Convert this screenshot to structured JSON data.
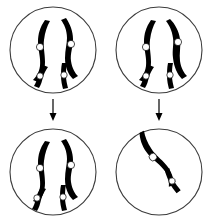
{
  "diagram": {
    "background_color": "#ffffff",
    "outline_color": "#3c3c3c",
    "chromosome_color": "#000000",
    "centromere_color": "#ffffff",
    "layout": "2x2 grid of circular cells with downward arrows",
    "cells": [
      {
        "id": "top-left",
        "label": "Top left parent cell",
        "center_x": 53,
        "center_y": 50,
        "radius": 43,
        "chromosome_count": 4,
        "chromosomes": [
          {
            "name": "large-left",
            "size": "large",
            "centromere_x": 40,
            "centromere_y": 47
          },
          {
            "name": "large-right",
            "size": "large",
            "centromere_x": 71,
            "centromere_y": 44
          },
          {
            "name": "small-left",
            "size": "small",
            "centromere_x": 40,
            "centromere_y": 76
          },
          {
            "name": "small-right",
            "size": "small",
            "centromere_x": 64,
            "centromere_y": 75
          }
        ]
      },
      {
        "id": "top-right",
        "label": "Top right parent cell",
        "center_x": 159,
        "center_y": 50,
        "radius": 43,
        "chromosome_count": 4,
        "chromosomes": [
          {
            "name": "large-left",
            "size": "large",
            "centromere_x": 146,
            "centromere_y": 47
          },
          {
            "name": "large-right",
            "size": "large",
            "centromere_x": 178,
            "centromere_y": 42
          },
          {
            "name": "small-left",
            "size": "small",
            "centromere_x": 146,
            "centromere_y": 76
          },
          {
            "name": "small-right",
            "size": "small",
            "centromere_x": 170,
            "centromere_y": 75
          }
        ]
      },
      {
        "id": "bottom-left",
        "label": "Bottom left daughter cell",
        "center_x": 53,
        "center_y": 172,
        "radius": 43,
        "chromosome_count": 4,
        "chromosomes": [
          {
            "name": "large-left",
            "size": "large",
            "centromere_x": 40,
            "centromere_y": 168
          },
          {
            "name": "large-right",
            "size": "large",
            "centromere_x": 71,
            "centromere_y": 165
          },
          {
            "name": "small-left",
            "size": "small",
            "centromere_x": 37,
            "centromere_y": 198
          },
          {
            "name": "small-right",
            "size": "small",
            "centromere_x": 63,
            "centromere_y": 197
          }
        ]
      },
      {
        "id": "bottom-right",
        "label": "Bottom right daughter cell",
        "center_x": 159,
        "center_y": 172,
        "radius": 43,
        "chromosome_count": 2,
        "chromosomes": [
          {
            "name": "large-diagonal",
            "size": "large",
            "centromere_x": 153,
            "centromere_y": 157
          },
          {
            "name": "small-diagonal",
            "size": "small",
            "centromere_x": 172,
            "centromere_y": 181
          }
        ]
      }
    ],
    "arrows": [
      {
        "name": "arrow-left",
        "direction": "down",
        "x": 53,
        "y_start": 97,
        "y_end": 120
      },
      {
        "name": "arrow-right",
        "direction": "down",
        "x": 159,
        "y_start": 97,
        "y_end": 120
      }
    ]
  }
}
